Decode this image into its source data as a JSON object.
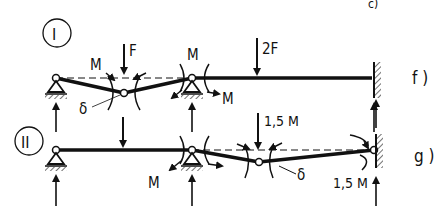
{
  "top_fragment": "c)",
  "systems": [
    {
      "id": "I",
      "case_label": "f )",
      "loads": {
        "force_1": "F",
        "force_2": "2F",
        "moment": "M",
        "deflection": "δ"
      }
    },
    {
      "id": "II",
      "case_label": "g )",
      "loads": {
        "moment_left": "M",
        "moment_right": "1,5 M",
        "moment_support": "1,5 M",
        "deflection": "δ"
      }
    }
  ],
  "colors": {
    "ink": "#111111",
    "background": "#ffffff"
  }
}
